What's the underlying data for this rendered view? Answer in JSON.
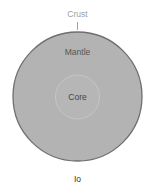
{
  "diagram": {
    "title": "Io",
    "layers": [
      {
        "name": "Crust",
        "label": "Crust"
      },
      {
        "name": "Mantle",
        "label": "Mantle"
      },
      {
        "name": "Core",
        "label": "Core"
      }
    ],
    "colors": {
      "background": "#ffffff",
      "body_fill": "#b3b3b3",
      "outline": "#6e6e6e",
      "core_ring": "#c4c4c4",
      "crust_text": "#a0a0a0",
      "label_text": "#555555",
      "title_text": "#333333"
    }
  }
}
